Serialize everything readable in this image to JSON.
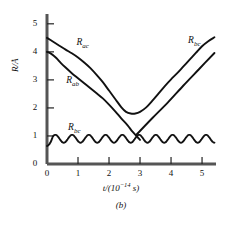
{
  "figure": {
    "panel_label": "(b)",
    "xlabel_main": "t/(10",
    "xlabel_exp": "−14",
    "xlabel_tail": " s)",
    "ylabel": "R/Å"
  },
  "chart_data": {
    "type": "line",
    "title": "",
    "xlabel": "t/(10^-14 s)",
    "ylabel": "R/Å",
    "xlim": [
      0,
      5.45
    ],
    "ylim": [
      0,
      5.35
    ],
    "xticks": [
      "0",
      "1",
      "2",
      "3",
      "4",
      "5"
    ],
    "xtick_values": [
      0,
      1,
      2,
      3,
      4,
      5
    ],
    "yticks": [
      "0",
      "1",
      "2",
      "3",
      "4",
      "5"
    ],
    "ytick_values": [
      0,
      1,
      2,
      3,
      4,
      5
    ],
    "grid": false,
    "legend_position": "inline-annotations",
    "series": [
      {
        "name": "R_ac",
        "label": "R",
        "label_sub": "ac",
        "label_x": 0.95,
        "label_y": 4.32,
        "points": [
          [
            0.0,
            4.5
          ],
          [
            0.2,
            4.36
          ],
          [
            0.4,
            4.22
          ],
          [
            0.6,
            4.08
          ],
          [
            0.8,
            3.95
          ],
          [
            1.0,
            3.8
          ],
          [
            1.2,
            3.62
          ],
          [
            1.4,
            3.42
          ],
          [
            1.6,
            3.18
          ],
          [
            1.8,
            2.92
          ],
          [
            2.0,
            2.62
          ],
          [
            2.2,
            2.32
          ],
          [
            2.4,
            2.02
          ],
          [
            2.55,
            1.86
          ],
          [
            2.7,
            1.8
          ],
          [
            2.85,
            1.8
          ],
          [
            3.0,
            1.86
          ],
          [
            3.2,
            2.02
          ],
          [
            3.4,
            2.26
          ],
          [
            3.6,
            2.52
          ],
          [
            3.8,
            2.78
          ],
          [
            4.0,
            3.02
          ],
          [
            4.2,
            3.24
          ],
          [
            4.4,
            3.48
          ],
          [
            4.6,
            3.72
          ],
          [
            4.8,
            3.96
          ],
          [
            5.0,
            4.2
          ],
          [
            5.2,
            4.38
          ],
          [
            5.4,
            4.52
          ]
        ]
      },
      {
        "name": "R_ab",
        "label": "R",
        "label_sub": "ab",
        "label_x": 0.62,
        "label_y": 2.96,
        "points": [
          [
            0.0,
            4.0
          ],
          [
            0.15,
            3.92
          ],
          [
            0.3,
            3.78
          ],
          [
            0.45,
            3.6
          ],
          [
            0.6,
            3.44
          ],
          [
            0.8,
            3.24
          ],
          [
            1.0,
            3.06
          ],
          [
            1.2,
            2.88
          ],
          [
            1.4,
            2.7
          ],
          [
            1.6,
            2.52
          ],
          [
            1.8,
            2.34
          ],
          [
            2.0,
            2.12
          ],
          [
            2.2,
            1.88
          ],
          [
            2.4,
            1.62
          ],
          [
            2.6,
            1.38
          ],
          [
            2.75,
            1.16
          ],
          [
            2.9,
            0.98
          ],
          [
            3.0,
            0.86
          ]
        ]
      },
      {
        "name": "R_bc_oscillating",
        "label": "R",
        "label_sub": "bc",
        "label_x": 0.68,
        "label_y": 1.28,
        "baseline": 0.9,
        "amplitude": 0.14,
        "cycles": 10,
        "start_value": 0.64,
        "end_value": 0.86,
        "x_start": 0.0,
        "x_end": 5.4
      },
      {
        "name": "R_bc_rising",
        "label": "R",
        "label_sub": "bc",
        "label_x": 4.55,
        "label_y": 4.4,
        "points": [
          [
            2.88,
            1.04
          ],
          [
            3.4,
            1.64
          ],
          [
            3.9,
            2.2
          ],
          [
            4.4,
            2.8
          ],
          [
            4.9,
            3.38
          ],
          [
            5.4,
            3.96
          ]
        ]
      }
    ],
    "crossings": [
      {
        "between": [
          "R_ac",
          "R_bc_rising"
        ],
        "x": 4.2,
        "y": 3.25
      }
    ]
  }
}
